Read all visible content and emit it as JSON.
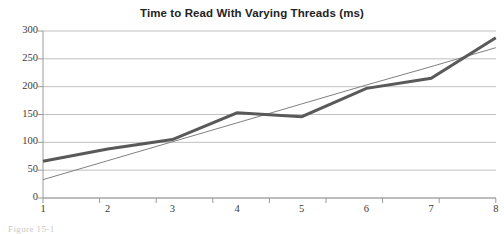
{
  "chart_data": {
    "type": "line",
    "title": "Time to Read With Varying Threads (ms)",
    "xlabel": "",
    "ylabel": "",
    "categories": [
      "1",
      "2",
      "3",
      "4",
      "5",
      "6",
      "7",
      "8"
    ],
    "x": [
      1,
      2,
      3,
      4,
      5,
      6,
      7,
      8
    ],
    "series": [
      {
        "name": "Time to Read",
        "role": "data",
        "color": "#595959",
        "line_width": 3,
        "values": [
          66,
          88,
          105,
          153,
          146,
          197,
          215,
          288
        ]
      },
      {
        "name": "Linear Trendline",
        "role": "trendline",
        "color": "#808080",
        "line_width": 1,
        "values": [
          33,
          67,
          101,
          135,
          169,
          203,
          236,
          270
        ]
      }
    ],
    "ylim": [
      0,
      300
    ],
    "yticks": [
      0,
      50,
      100,
      150,
      200,
      250,
      300
    ],
    "ytick_labels": [
      "0",
      "50",
      "100",
      "150",
      "200",
      "250",
      "300"
    ],
    "xtick_labels": [
      "1",
      "2",
      "3",
      "4",
      "5",
      "6",
      "7",
      "8"
    ],
    "grid": {
      "horizontal": true,
      "vertical": false,
      "color": "#c0c0c0"
    },
    "legend": {
      "visible": false,
      "position": "none"
    },
    "axis_color": "#9a9a9a",
    "background": "#ffffff",
    "title_color": "#232323"
  },
  "caption": {
    "text": "Figure 15-1"
  }
}
